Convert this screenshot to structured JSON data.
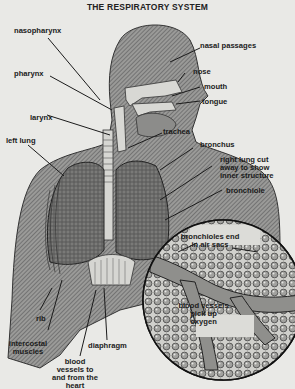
{
  "title": "THE RESPIRATORY SYSTEM",
  "colors": {
    "background": "#e9e9e6",
    "body_fill": "#8a8a8a",
    "lung_fill": "#6e6e6e",
    "airway_fill": "#d8d8d4",
    "inset_fill": "#dcdcd8",
    "label_text": "#1b1b1b",
    "leader_lines": "#1b1b1b"
  },
  "labels": {
    "nasopharynx": "nasopharynx",
    "nasal_passages": "nasal passages",
    "pharynx": "pharynx",
    "nose": "nose",
    "mouth": "mouth",
    "tongue": "tongue",
    "larynx": "larynx",
    "trachea": "trachea",
    "left_lung": "left lung",
    "bronchus": "bronchus",
    "right_lung_cut": "right lung cut away to show inner structure",
    "bronchiole": "bronchiole",
    "bronchioles_end": "bronchioles end in air sacs",
    "blood_vessels_oxygen": "blood vessels pick up oxygen",
    "rib": "rib",
    "intercostal_muscles": "intercostal muscles",
    "diaphragm": "diaphragm",
    "blood_vessels_heart": "blood vessels to and from the heart"
  }
}
